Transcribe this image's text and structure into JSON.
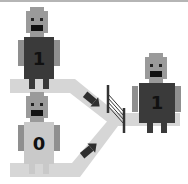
{
  "diagram": {
    "colors": {
      "background": "#ffffff",
      "border": "#b5b5b5",
      "path": "#d6d6d6",
      "head": "#9a9a9a",
      "eyes": "#222222",
      "mouth": "#111111",
      "body_dark": "#3a3a3a",
      "body_light": "#c9c9c9",
      "arms": "#8f8f8f",
      "arrow": "#2e2e2e",
      "fence": "#333333"
    },
    "robots": [
      {
        "id": "input-top",
        "label": "1",
        "body": "dark"
      },
      {
        "id": "input-bottom",
        "label": "0",
        "body": "light"
      },
      {
        "id": "output",
        "label": "1",
        "body": "dark"
      }
    ],
    "arrows": [
      {
        "id": "arrow-top",
        "direction": "down-right"
      },
      {
        "id": "arrow-bottom",
        "direction": "up-right"
      }
    ],
    "gate": {
      "type": "fence"
    }
  }
}
